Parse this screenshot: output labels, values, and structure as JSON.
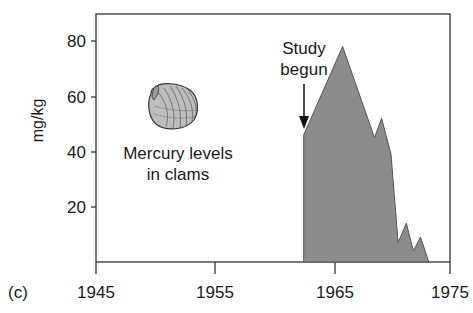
{
  "panel_label": "(c)",
  "chart_data": {
    "type": "area",
    "title": "",
    "xlabel": "",
    "ylabel": "mg/kg",
    "xlim": [
      1945,
      1975
    ],
    "ylim": [
      0,
      90
    ],
    "x_ticks": [
      "1945",
      "1955",
      "1965",
      "1975"
    ],
    "y_ticks": [
      "20",
      "40",
      "60",
      "80"
    ],
    "grid": false,
    "legend": null,
    "series": [
      {
        "name": "Mercury levels in clams",
        "color": "#8c8c8c",
        "x": [
          1962.6,
          1965.9,
          1968.6,
          1969.2,
          1970.0,
          1970.6,
          1971.3,
          1971.9,
          1972.5,
          1973.2
        ],
        "values": [
          46,
          78,
          45,
          52,
          39,
          7,
          14,
          4,
          9,
          0
        ]
      }
    ],
    "annotations": [
      {
        "text": "Study begun",
        "x": 1962.6,
        "y": 46,
        "arrow": true
      },
      {
        "text": "Mercury levels in clams",
        "icon": "clam-shell"
      }
    ]
  },
  "labels": {
    "ylabel": "mg/kg",
    "annotation_study_line1": "Study",
    "annotation_study_line2": "begun",
    "caption_line1": "Mercury levels",
    "caption_line2": "in clams",
    "x_ticks": [
      "1945",
      "1955",
      "1965",
      "1975"
    ],
    "y_ticks": [
      "80",
      "60",
      "40",
      "20"
    ]
  }
}
